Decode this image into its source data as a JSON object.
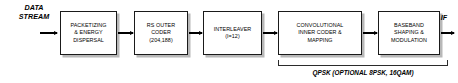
{
  "diagram": {
    "input_label": "DATA\nSTREAM",
    "input_label_line1": "DATA",
    "input_label_line2": "STREAM",
    "output_label": "IF",
    "blocks": [
      {
        "id": "packetizing",
        "lines": [
          "PACKETIZING",
          "& ENERGY",
          "DISPERSAL"
        ]
      },
      {
        "id": "rs-outer-coder",
        "lines": [
          "RS OUTER",
          "CODER",
          "(204,188)"
        ]
      },
      {
        "id": "interleaver",
        "lines": [
          "INTERLEAVER",
          "(I=12)"
        ]
      },
      {
        "id": "convolutional-inner-coder",
        "lines": [
          "CONVOLUTIONAL",
          "INNER CODER &",
          "MAPPING"
        ]
      },
      {
        "id": "baseband-shaping",
        "lines": [
          "BASEBAND",
          "SHAPING &",
          "MODULATION"
        ]
      }
    ],
    "bracket_caption": "QPSK (OPTIONAL 8PSK, 16QAM)",
    "colors": {
      "stroke": "#1a1a1a",
      "shadow": "#b8b8b8",
      "fill": "#ffffff",
      "text": "#000000"
    }
  }
}
